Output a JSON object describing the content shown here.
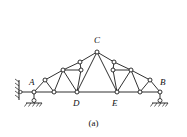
{
  "figure": {
    "caption": "(a)",
    "type": "truss-diagram",
    "stroke_color": "#1a1a1a",
    "node_fill": "#ffffff",
    "background": "#ffffff",
    "canvas": {
      "width": 187,
      "height": 137
    }
  },
  "labels": [
    {
      "id": "A",
      "text": "A",
      "x": 29,
      "y": 78
    },
    {
      "id": "B",
      "text": "B",
      "x": 160,
      "y": 78
    },
    {
      "id": "C",
      "text": "C",
      "x": 94,
      "y": 36
    },
    {
      "id": "D",
      "text": "D",
      "x": 73,
      "y": 99
    },
    {
      "id": "E",
      "text": "E",
      "x": 112,
      "y": 99
    }
  ],
  "nodes": [
    {
      "id": "A",
      "x": 34,
      "y": 92
    },
    {
      "id": "n1",
      "x": 54,
      "y": 92
    },
    {
      "id": "D",
      "x": 77,
      "y": 92
    },
    {
      "id": "E",
      "x": 117,
      "y": 92
    },
    {
      "id": "n2",
      "x": 140,
      "y": 92
    },
    {
      "id": "B",
      "x": 160,
      "y": 92
    },
    {
      "id": "L1",
      "x": 45,
      "y": 80
    },
    {
      "id": "L2",
      "x": 63,
      "y": 70
    },
    {
      "id": "L3",
      "x": 80,
      "y": 62
    },
    {
      "id": "L4",
      "x": 81,
      "y": 70
    },
    {
      "id": "R1",
      "x": 150,
      "y": 80
    },
    {
      "id": "R2",
      "x": 131,
      "y": 70
    },
    {
      "id": "R3",
      "x": 114,
      "y": 62
    },
    {
      "id": "R4",
      "x": 113,
      "y": 70
    },
    {
      "id": "C",
      "x": 97,
      "y": 52
    }
  ],
  "members": [
    {
      "from": "A",
      "to": "n1"
    },
    {
      "from": "n1",
      "to": "D"
    },
    {
      "from": "D",
      "to": "E"
    },
    {
      "from": "E",
      "to": "n2"
    },
    {
      "from": "n2",
      "to": "B"
    },
    {
      "from": "A",
      "to": "L1"
    },
    {
      "from": "L1",
      "to": "L2"
    },
    {
      "from": "L2",
      "to": "L3"
    },
    {
      "from": "L3",
      "to": "C"
    },
    {
      "from": "B",
      "to": "R1"
    },
    {
      "from": "R1",
      "to": "R2"
    },
    {
      "from": "R2",
      "to": "R3"
    },
    {
      "from": "R3",
      "to": "C"
    },
    {
      "from": "L1",
      "to": "n1"
    },
    {
      "from": "L2",
      "to": "n1"
    },
    {
      "from": "L2",
      "to": "D"
    },
    {
      "from": "L2",
      "to": "L4"
    },
    {
      "from": "L4",
      "to": "L3"
    },
    {
      "from": "L4",
      "to": "D"
    },
    {
      "from": "C",
      "to": "D"
    },
    {
      "from": "R1",
      "to": "n2"
    },
    {
      "from": "R2",
      "to": "n2"
    },
    {
      "from": "R2",
      "to": "E"
    },
    {
      "from": "R2",
      "to": "R4"
    },
    {
      "from": "R4",
      "to": "R3"
    },
    {
      "from": "R4",
      "to": "E"
    },
    {
      "from": "C",
      "to": "E"
    }
  ],
  "supports": [
    {
      "id": "left-support",
      "type": "pin-on-wall-with-roller",
      "x": 34,
      "y": 92
    },
    {
      "id": "right-support",
      "type": "roller-on-ground",
      "x": 160,
      "y": 92
    }
  ]
}
